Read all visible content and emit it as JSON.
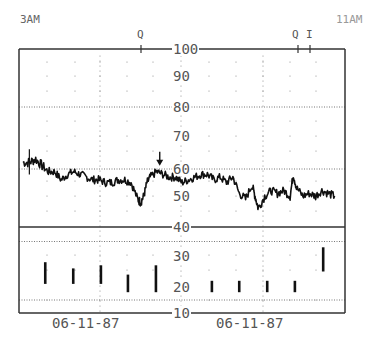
{
  "header": {
    "start_time": "3AM",
    "end_time": "11AM",
    "markers_top": [
      {
        "label": "Q",
        "x": 141
      },
      {
        "label": "Q",
        "x": 298
      },
      {
        "label": "I",
        "x": 310
      }
    ]
  },
  "footer": {
    "date_left": "06-11-87",
    "date_right": "06-11-87"
  },
  "colors": {
    "trace": "#111111",
    "frame": "#333333",
    "grid": "#777777",
    "text": "#555555",
    "background": "#ffffff"
  },
  "chart_data": {
    "type": "line",
    "title": "",
    "xlabel": "",
    "ylabel": "",
    "ylim": [
      10,
      100
    ],
    "yticks": [
      100,
      90,
      80,
      70,
      60,
      50,
      40,
      30,
      20,
      10
    ],
    "x_range_labels": [
      "3AM",
      "11AM"
    ],
    "date_labels": [
      "06-11-87",
      "06-11-87"
    ],
    "grid": {
      "dotted_horizontal_at": [
        80,
        60,
        35,
        15
      ],
      "solid_horizontal_at": [
        40
      ]
    },
    "annotations": [
      {
        "type": "arrow",
        "label": "down-arrow",
        "x_frac": 0.43,
        "value": 61
      },
      {
        "type": "marker",
        "label": "Q",
        "x_frac": 0.375
      },
      {
        "type": "marker",
        "label": "Q",
        "x_frac": 0.857
      },
      {
        "type": "marker",
        "label": "I",
        "x_frac": 0.893
      }
    ],
    "series": [
      {
        "name": "upper-trace",
        "x_frac": [
          0.0,
          0.02,
          0.04,
          0.06,
          0.08,
          0.1,
          0.12,
          0.14,
          0.16,
          0.18,
          0.2,
          0.22,
          0.24,
          0.26,
          0.28,
          0.3,
          0.32,
          0.34,
          0.36,
          0.37,
          0.38,
          0.39,
          0.4,
          0.42,
          0.44,
          0.46,
          0.48,
          0.5,
          0.52,
          0.54,
          0.56,
          0.58,
          0.6,
          0.62,
          0.64,
          0.66,
          0.68,
          0.7,
          0.72,
          0.73,
          0.74,
          0.76,
          0.78,
          0.8,
          0.82,
          0.84,
          0.85,
          0.86,
          0.88,
          0.9,
          0.92,
          0.94,
          0.96,
          0.98
        ],
        "values": [
          62,
          62,
          63,
          61,
          59,
          59,
          56,
          58,
          59,
          58,
          57,
          56,
          56,
          55,
          55,
          56,
          56,
          55,
          49,
          48,
          50,
          55,
          57,
          59,
          58,
          57,
          57,
          55,
          56,
          57,
          58,
          58,
          56,
          57,
          55,
          57,
          51,
          49,
          54,
          50,
          46,
          50,
          52,
          51,
          52,
          50,
          58,
          53,
          50,
          51,
          50,
          52,
          51,
          50
        ]
      },
      {
        "name": "lower-bars",
        "type": "bar-segments",
        "bars": [
          {
            "x_frac": 0.07,
            "bottom": 21,
            "top": 28
          },
          {
            "x_frac": 0.158,
            "bottom": 21,
            "top": 26
          },
          {
            "x_frac": 0.245,
            "bottom": 21,
            "top": 27
          },
          {
            "x_frac": 0.33,
            "bottom": 18,
            "top": 24
          },
          {
            "x_frac": 0.418,
            "bottom": 18,
            "top": 27
          },
          {
            "x_frac": 0.594,
            "bottom": 18,
            "top": 22
          },
          {
            "x_frac": 0.68,
            "bottom": 18,
            "top": 22
          },
          {
            "x_frac": 0.768,
            "bottom": 18,
            "top": 22
          },
          {
            "x_frac": 0.855,
            "bottom": 18,
            "top": 22
          },
          {
            "x_frac": 0.944,
            "bottom": 25,
            "top": 33
          }
        ]
      }
    ]
  }
}
